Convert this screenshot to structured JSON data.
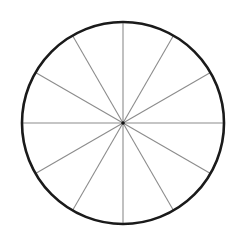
{
  "diagram": {
    "type": "divided-circle",
    "segments": 12,
    "segment_angle_deg": 30,
    "center": {
      "x": 123,
      "y": 123
    },
    "radius": 101,
    "colors": {
      "background": "#ffffff",
      "outline": "#1a1a1a",
      "spokes": "#8c8c8c",
      "center_dot": "#111111"
    },
    "outline_width": 2.6,
    "spoke_width": 1.1,
    "center_dot_radius": 1.8
  }
}
